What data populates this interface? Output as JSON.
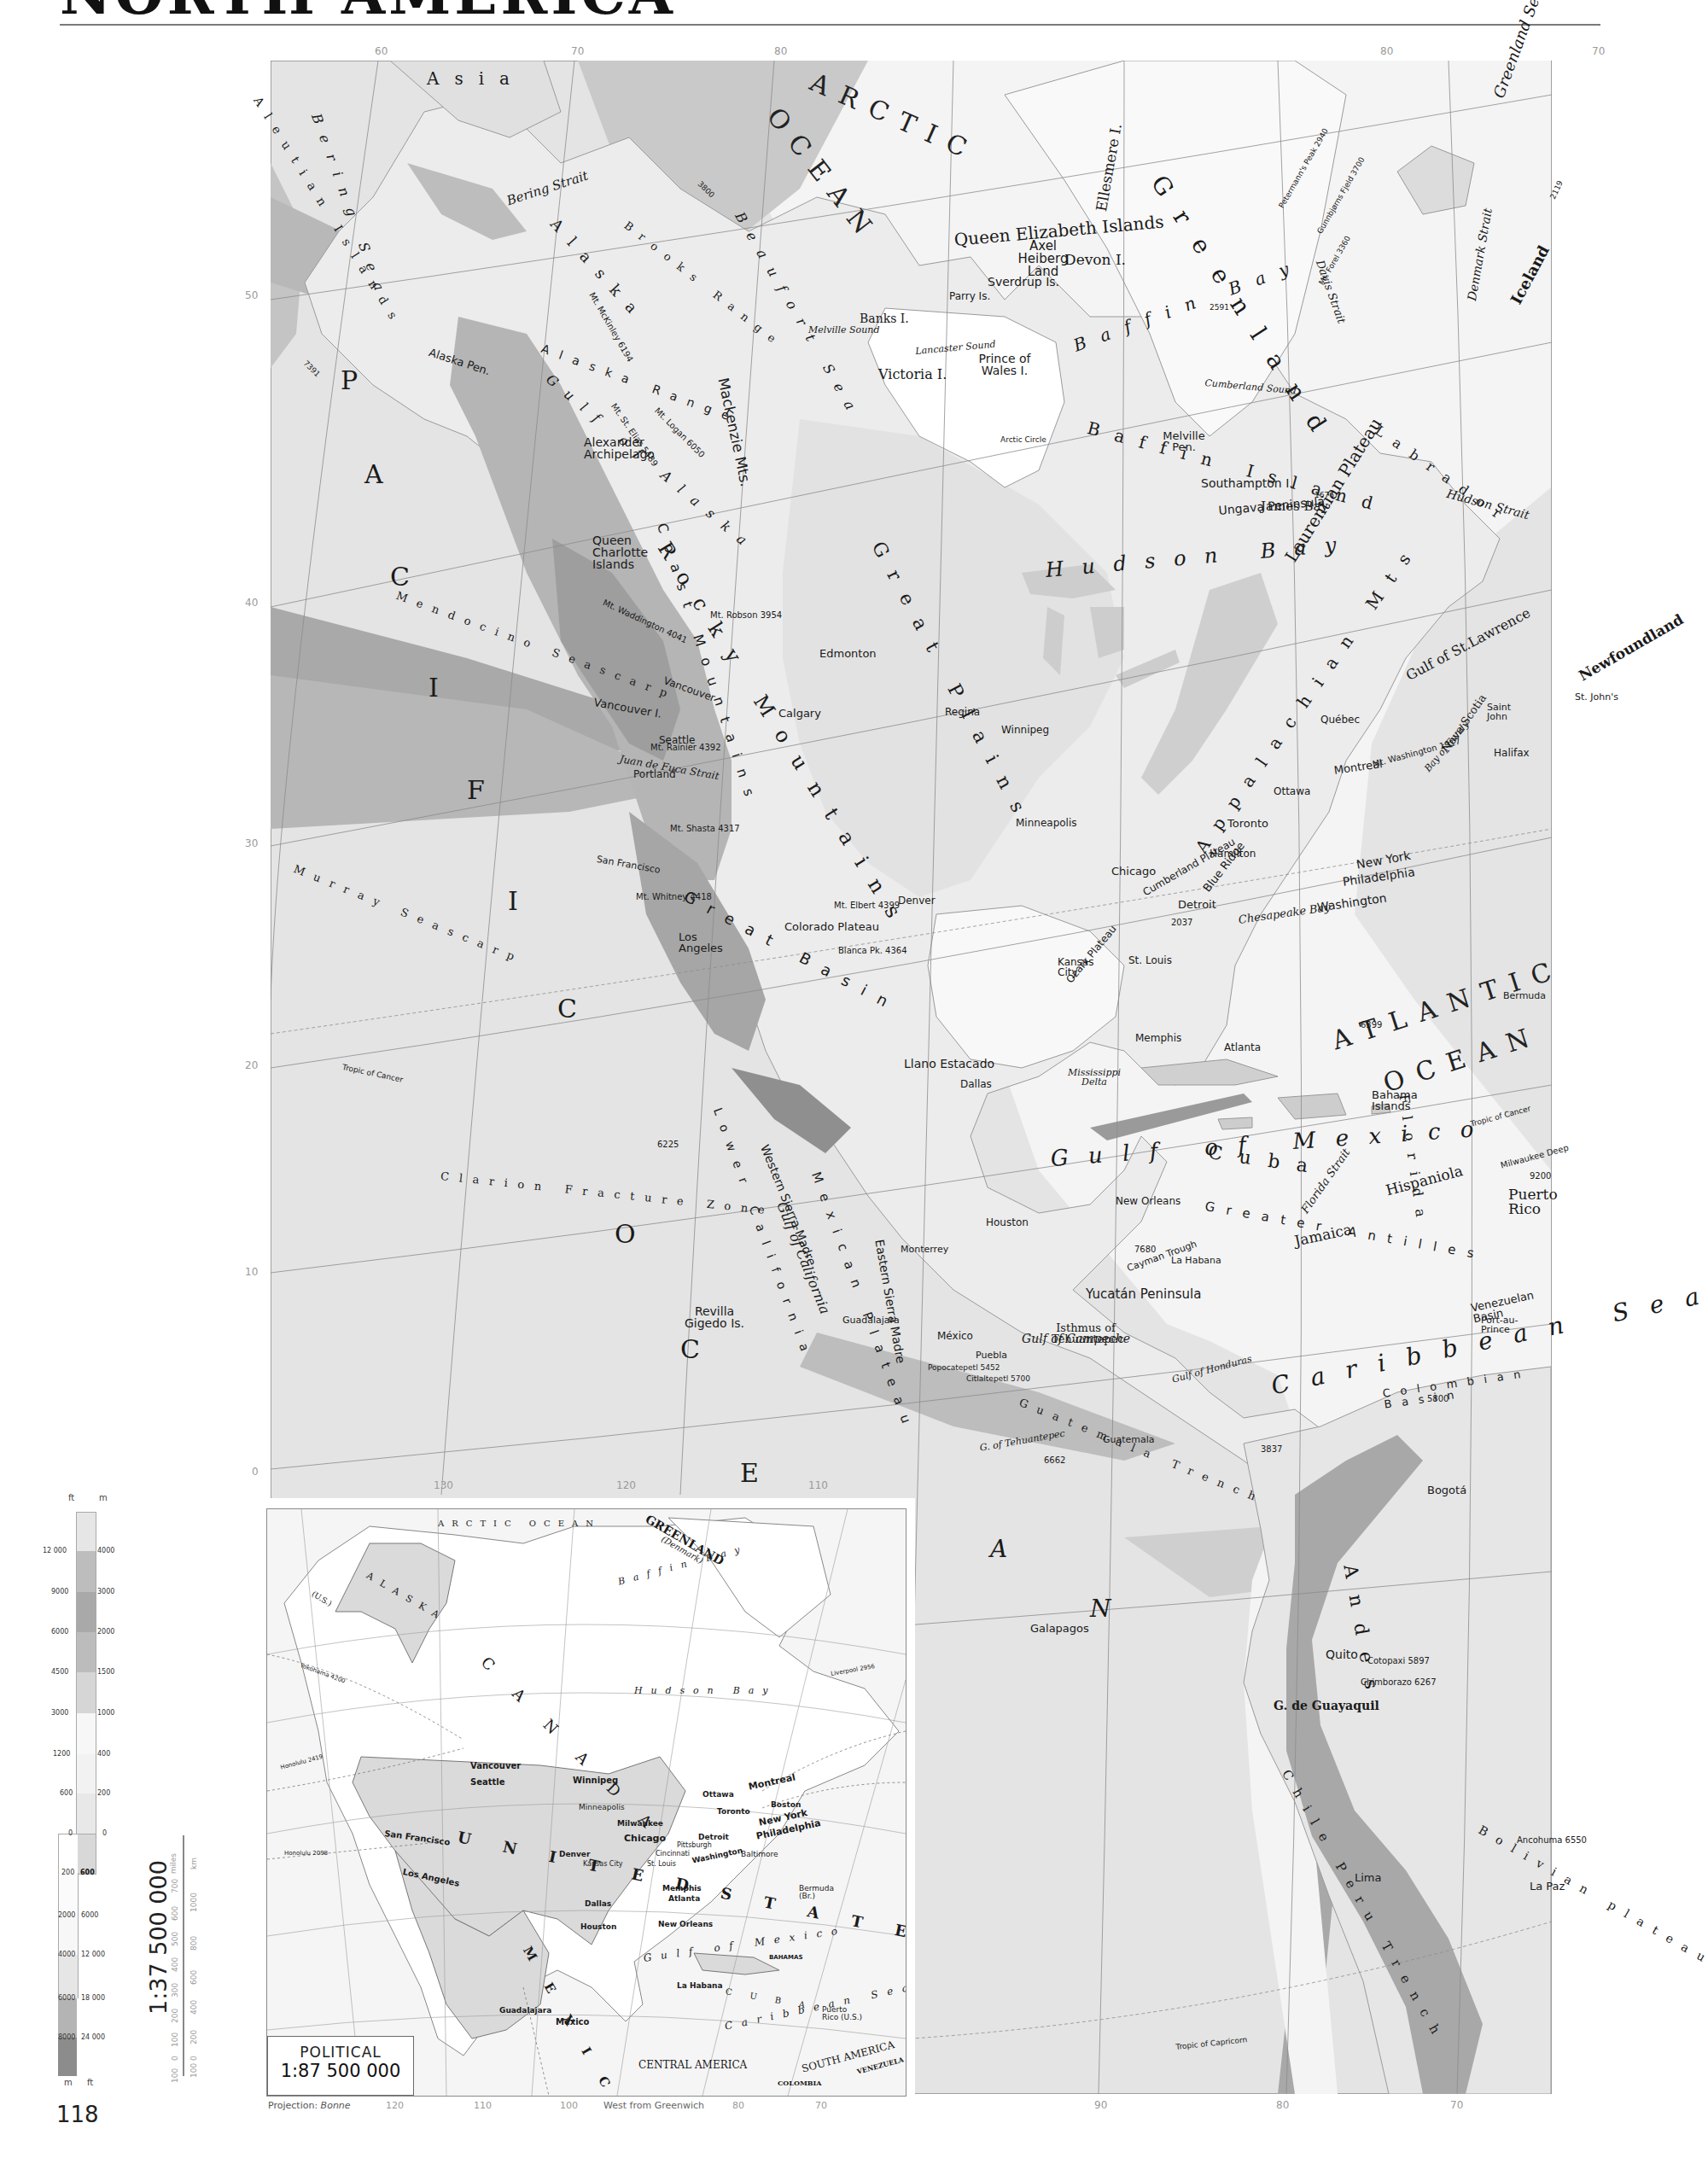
{
  "page": {
    "title": "NORTH AMERICA",
    "page_number": "118"
  },
  "main_map": {
    "scale": "1:37 500 000",
    "scale_units": [
      "miles",
      "km"
    ],
    "scale_miles_ticks": [
      "100",
      "0",
      "100",
      "200",
      "300",
      "400",
      "500",
      "600",
      "700"
    ],
    "scale_km_ticks": [
      "100",
      "0",
      "200",
      "400",
      "600",
      "800",
      "1000"
    ],
    "top_longitudes": [
      "60",
      "70",
      "80",
      "140",
      "120",
      "100",
      "80",
      "60",
      "80",
      "70"
    ],
    "left_latitudes": [
      "50",
      "40",
      "30",
      "20",
      "10",
      "0"
    ],
    "bottom_longitudes": [
      "130",
      "120",
      "110",
      "90",
      "80",
      "70"
    ],
    "right_latitudes": [
      "60",
      "50",
      "40",
      "30"
    ],
    "oceans": {
      "arctic_1": "ARCTIC",
      "arctic_2": "OCEAN",
      "atlantic_1": "ATLANTIC",
      "atlantic_2": "OCEAN",
      "pacific_letters": [
        "P",
        "A",
        "C",
        "I",
        "F",
        "I",
        "C",
        "O",
        "C",
        "E",
        "A",
        "N"
      ]
    },
    "seas": {
      "bering_sea": "Bering Sea",
      "beaufort_sea": "Beaufort Sea",
      "greenland_sea": "Greenland Sea",
      "baffin_bay": "Baffin Bay",
      "hudson_bay": "Hudson Bay",
      "gulf_of_mexico": "Gulf of Mexico",
      "caribbean_sea": "Caribbean Sea",
      "gulf_of_alaska": "Gulf of Alaska",
      "gulf_of_california": "Gulf of California",
      "gulf_of_st_lawrence": "Gulf of St.Lawrence",
      "gulf_of_campeche": "Gulf of Campeche",
      "gulf_of_honduras": "Gulf of Honduras",
      "g_of_tehuantepec": "G. of Tehuantepec",
      "james_bay": "James Bay",
      "foxe_basin": "Foxe Basin",
      "chesapeake_bay": "Chesapeake Bay",
      "bay_of_fundy": "Bay of Fundy",
      "g_de_guayaquil": "G. de Guayaquil",
      "g_of_panama": "G. of Panama",
      "g_of_darien": "G. of Darien",
      "g_of_venezuela": "G. of Venezuela"
    },
    "straits": {
      "bering_strait": "Bering Strait",
      "davis_strait": "Davis Strait",
      "denmark_strait": "Denmark Strait",
      "hudson_strait": "Hudson Strait",
      "florida_strait": "Florida Strait",
      "yucatan_strait": "Yucatán Strait",
      "juan_de_fuca": "Juan de Fuca Strait",
      "belle_isle": "Belle Isle Strait",
      "lancaster_sound": "Lancaster Sound",
      "melville_sound": "Melville Sound",
      "cumberland_sound": "Cumberland Sound",
      "queen_charlotte_sound": "Queen Charlotte Sound",
      "mclure_strait": "M'Clure Strait"
    },
    "landforms": {
      "asia": "Asia",
      "greenland": "Greenland",
      "iceland": "Iceland",
      "alaska": "Alaska",
      "alaska_range": "Alaska Range",
      "brooks_range": "Brooks Range",
      "alaska_pen": "Alaska Pen.",
      "aleutian_islands": "Aleutian Islands",
      "mackenzie_mts": "Mackenzie Mts.",
      "rocky_mountains": "Rocky Mountains",
      "coast_mountains": "Coast Mountains",
      "great_plains": "Great Plains",
      "great_basin": "Great Basin",
      "colorado_plateau": "Colorado Plateau",
      "laurentian_plateau": "Laurentian Plateau",
      "appalachian_mts": "Appalachian Mts",
      "allegheny_mts": "Allegheny Mts",
      "blue_ridge": "Blue Ridge",
      "cumberland_plateau": "Cumberland Plateau",
      "ozark_plateau": "Ozark Plateau",
      "llano_estacado": "Llano Estacado",
      "mexican_plateau": "Mexican Plateau",
      "western_sierra_madre": "Western Sierra Madre",
      "eastern_sierra_madre": "Eastern Sierra Madre",
      "lower_california": "Lower California",
      "yucatan_peninsula": "Yucatán Peninsula",
      "isthmus_tehuantepec": "Isthmus of Tehuantepec",
      "andes": "Andes",
      "bolivian_plateau": "Bolivian plateau",
      "labrador": "Labrador",
      "ungava_peninsula": "Ungava Peninsula",
      "queen_elizabeth_islands": "Queen Elizabeth Islands",
      "baffin_island": "Baffin Island",
      "victoria_i": "Victoria I.",
      "banks_i": "Banks I.",
      "devon_i": "Devon I.",
      "ellesmere_i": "Ellesmere I.",
      "axel_heiberg_land": "Axel Heiberg Land",
      "sverdrup_is": "Sverdrup Is.",
      "parry_is": "Parry Is.",
      "prince_of_wales_i": "Prince of Wales I.",
      "southampton_i": "Southampton I.",
      "melville_pen": "Melville Pen.",
      "newfoundland": "Newfoundland",
      "nova_scotia": "Nova Scotia",
      "alexander_archipelago": "Alexander Archipelago",
      "queen_charlotte_islands": "Queen Charlotte Islands",
      "vancouver_i": "Vancouver I.",
      "florida": "Florida",
      "cuba": "Cuba",
      "hispaniola": "Hispaniola",
      "jamaica": "Jamaica",
      "puerto_rico": "Puerto Rico",
      "bahama_islands": "Bahama Islands",
      "greater_antilles": "Greater Antilles",
      "bermuda": "Bermuda",
      "galapagos": "Galapagos",
      "revilla_gigedo": "Revilla Gigedo Is.",
      "mississippi_delta": "Mississippi Delta"
    },
    "seafloor": {
      "mendocino": "Mendocino Seascarp",
      "murray": "Murray Seascarp",
      "clarion": "Clarion Fracture Zone",
      "guatemala_trench": "Guatemala Trench",
      "chile_peru_trench": "Chile Peru Trench",
      "cayman_trough": "Cayman Trough",
      "milwaukee_deep": "Milwaukee Deep",
      "colombian_basin": "Colombian Basin",
      "venezuelan_basin": "Venezuelan Basin",
      "yucatan_basin": "Yucatán Basin"
    },
    "cities": [
      "Edmonton",
      "Calgary",
      "Regina",
      "Winnipeg",
      "Vancouver",
      "Seattle",
      "Portland",
      "San Francisco",
      "Los Angeles",
      "Denver",
      "Dallas",
      "Houston",
      "New Orleans",
      "Kansas City",
      "St. Louis",
      "Memphis",
      "Atlanta",
      "Chicago",
      "Minneapolis",
      "Detroit",
      "Toronto",
      "Hamilton",
      "Ottawa",
      "Montreal",
      "Québec",
      "New York",
      "Philadelphia",
      "Washington",
      "Halifax",
      "Saint John",
      "St. John's",
      "Monterrey",
      "Guadalajara",
      "México",
      "Puebla",
      "Guatemala",
      "La Habana",
      "Port-au-Prince",
      "Bogotá",
      "Quito",
      "Lima",
      "La Paz"
    ],
    "peaks": {
      "mckinley": "Mt. McKinley 6194",
      "st_elias": "Mt. St. Elias 5489",
      "logan": "Mt. Logan 6050",
      "robson": "Mt. Robson 3954",
      "waddington": "Mt. Waddington 4041",
      "rainier": "Mt. Rainier 4392",
      "shasta": "Mt. Shasta 4317",
      "whitney": "Mt. Whitney 4418",
      "elbert": "Mt. Elbert 4399",
      "blanca": "Blanca Pk. 4364",
      "popocatepetl": "Popocatepetl 5452",
      "citlaltepetl": "Citlaltepetl 5700",
      "washington": "Mt. Washington 1917",
      "appalachian": "2037",
      "gunnbjorns": "Gunnbjørns Fjeld 3700",
      "petermanns": "Petermann's Peak 2940",
      "forel": "Mt. Forel 3360",
      "iceland_peak": "2119",
      "baffin_peak": "2591",
      "labrador_peak": "1676",
      "cotopaxi": "Cotopaxi 5897",
      "chimborazo": "Chimborazo 6267",
      "sta_marta": "5800",
      "ancohuma": "Ancohuma 6550",
      "panama_peak": "3837"
    },
    "depths": {
      "arctic": "3800",
      "aleutian": "7391",
      "atlantic": "6399",
      "pacific": "6225",
      "guatemala": "6662",
      "cayman": "7680",
      "milwaukee": "9200"
    },
    "lines": {
      "tropic_of_cancer": "Tropic of Cancer",
      "tropic_of_capricorn": "Tropic of Capricorn",
      "arctic_circle": "Arctic Circle"
    }
  },
  "elevation_legend": {
    "header_left": "ft",
    "header_right": "m",
    "footer_left": "m",
    "footer_right": "ft",
    "land": [
      {
        "ft": "12 000",
        "m": "4000",
        "color": "#bdbdbd"
      },
      {
        "ft": "9000",
        "m": "3000",
        "color": "#a9a9a9"
      },
      {
        "ft": "6000",
        "m": "2000",
        "color": "#bcbcbc"
      },
      {
        "ft": "4500",
        "m": "1500",
        "color": "#d6d6d6"
      },
      {
        "ft": "3000",
        "m": "1000",
        "color": "#e8e8e8"
      },
      {
        "ft": "1200",
        "m": "400",
        "color": "#f4f4f4"
      },
      {
        "ft": "600",
        "m": "200",
        "color": "#ececec"
      },
      {
        "ft": "0",
        "m": "0",
        "color": "#dcdcdc"
      }
    ],
    "top_band_color": "#e6e6e6",
    "sea": [
      {
        "m": "200",
        "ft": "600",
        "color": "#f7f7f7"
      },
      {
        "m": "2000",
        "ft": "6000",
        "color": "#f0f0f0"
      },
      {
        "m": "4000",
        "ft": "12 000",
        "color": "#e2e2e2"
      },
      {
        "m": "6000",
        "ft": "18 000",
        "color": "#b6b6b6"
      },
      {
        "m": "8000",
        "ft": "24 000",
        "color": "#8f8f8f"
      }
    ]
  },
  "inset": {
    "title": "POLITICAL",
    "scale": "1:87 500 000",
    "projection_label": "Projection:",
    "projection_value": "Bonne",
    "meridian_note": "West from Greenwich",
    "bottom_longitudes": [
      "120",
      "110",
      "100",
      "90",
      "80",
      "70"
    ],
    "left_latitudes": [
      "40",
      "30",
      "20",
      "10"
    ],
    "countries": {
      "canada": "C A N A D A",
      "usa": "U N I T E D   S T A T E S",
      "mexico": "M E X I C O",
      "greenland": "GREENLAND",
      "greenland_note": "(Denmark)",
      "alaska": "ALASKA",
      "alaska_note": "(U.S.)",
      "central_america": "CENTRAL AMERICA",
      "south_america": "SOUTH AMERICA",
      "colombia": "COLOMBIA",
      "venezuela": "VENEZUELA",
      "cuba": "C U B A",
      "bahamas": "BAHAMAS",
      "belize": "BELIZE",
      "guatemala": "GUATEMALA",
      "honduras": "HONDURAS",
      "el_salvador": "EL SALVADOR",
      "nicaragua": "NICARAGUA",
      "costa_rica": "COSTA RICA",
      "panama": "PANAMA",
      "haiti": "HAITI",
      "dom_rep": "DOM. REP.",
      "jamaica": "JAMAICA",
      "puerto_rico": "Puerto Rico (U.S.)",
      "bermuda": "Bermuda (Br.)",
      "trinidad": "TRINIDAD & TOBAGO",
      "guadeloupe": "Guadeloupe (Fr.)",
      "martinique": "Martinique (Fr.)",
      "ussr": "U.S.S.R."
    },
    "water": {
      "arctic": "ARCTIC OCEAN",
      "pacific": "P A C I F I C   O C E A N",
      "atlantic": "A T L A N T I C   O C E A N",
      "hudson_bay": "Hudson Bay",
      "gulf_of_mexico": "Gulf of Mexico",
      "caribbean": "Caribbean Sea",
      "baffin_bay": "Baffin Bay",
      "beaufort_sea": "Beaufort Sea",
      "bering_sea": "Bering Sea"
    },
    "cities_major": [
      "Vancouver",
      "Seattle",
      "Winnipeg",
      "Montreal",
      "Chicago",
      "Milwaukee",
      "Detroit",
      "Toronto",
      "Boston",
      "New York",
      "Philadelphia",
      "Baltimore",
      "Washington",
      "Pittsburgh",
      "Cincinnati",
      "St. Louis",
      "Minneapolis",
      "Kansas City",
      "Denver",
      "San Francisco",
      "Los Angeles",
      "Dallas",
      "Houston",
      "New Orleans",
      "Memphis",
      "Atlanta",
      "México",
      "Guadalajara",
      "La Habana",
      "Ottawa"
    ],
    "cities_minor": [
      "Anchorage",
      "Dawson",
      "Skagway",
      "Juneau",
      "Pr. Rupert",
      "Victoria",
      "Portland",
      "Spokane",
      "Edmonton",
      "Calgary",
      "Saskatoon",
      "Regina",
      "Lethbridge",
      "Medicine Hat",
      "Churchill",
      "Timmins",
      "Québec",
      "Halifax",
      "St. John's",
      "Oakland",
      "Salt Lake City",
      "Omaha",
      "St Paul",
      "El Paso",
      "Monterrey",
      "Tampico",
      "Mérida",
      "Veracruz",
      "Acapulco",
      "Coatzacoalcos",
      "Salina Cruz",
      "Guatemala",
      "Panamá",
      "Cartagena",
      "Maracaibo",
      "Caracas",
      "Kingston",
      "Miami",
      "Galveston",
      "Buffalo",
      "Godthåb"
    ],
    "shipping_routes": [
      "Yokohama 4200",
      "Honolulu 2419",
      "Sydney 6848",
      "Honolulu 2098",
      "Sydney 6467",
      "Liverpool 2956",
      "Liverpool 4361",
      "Southampton 3177",
      "Valparaiso 5138",
      "S.F.-Seattle 702",
      "N.Y. 1187",
      "1972",
      "1380",
      "585",
      "710",
      "3277"
    ]
  }
}
